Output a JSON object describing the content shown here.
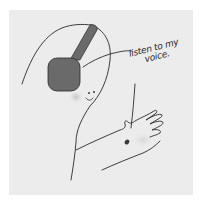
{
  "illustration": {
    "subject": "hand-drawn figure wearing headphones with a hand reaching out",
    "caption_lines": [
      "listen to my",
      "voice."
    ],
    "colors": {
      "background": "#ffffff",
      "paper": "#ececec",
      "ink": "#2a2a2a",
      "headphones": "#6a6a6a",
      "blush": "#c8c8c8"
    }
  }
}
